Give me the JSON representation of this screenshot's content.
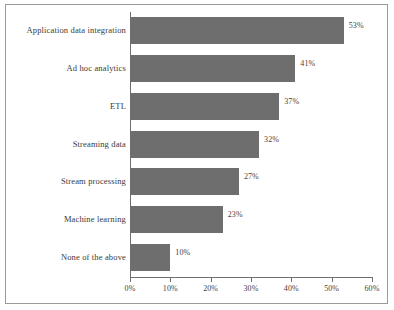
{
  "chart_data": {
    "type": "bar",
    "orientation": "horizontal",
    "title": "",
    "xlabel": "",
    "ylabel": "",
    "categories": [
      "Application data integration",
      "Ad hoc analytics",
      "ETL",
      "Streaming data",
      "Stream processing",
      "Machine learning",
      "None of the above"
    ],
    "values": [
      53,
      41,
      37,
      32,
      27,
      23,
      10
    ],
    "value_labels": [
      "53%",
      "41%",
      "37%",
      "32%",
      "27%",
      "23%",
      "10%"
    ],
    "xlim": [
      0,
      60
    ],
    "xticks": [
      0,
      10,
      20,
      30,
      40,
      50,
      60
    ],
    "xtick_labels": [
      "0%",
      "10%",
      "20%",
      "30%",
      "40%",
      "50%",
      "60%"
    ],
    "grid": false,
    "legend": null,
    "bar_color": "#6e6e6e",
    "axis_color": "#6f6f6f",
    "text_color": "#3a3a3a",
    "background": "#ffffff"
  }
}
